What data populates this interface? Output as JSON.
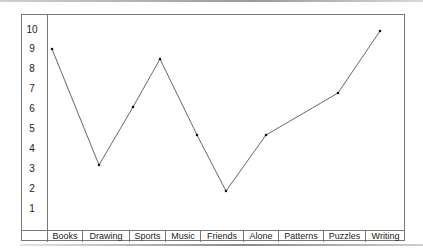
{
  "chart_data": {
    "type": "line",
    "title": "",
    "xlabel": "",
    "ylabel": "",
    "categories": [
      "Books",
      "Drawing",
      "Sports",
      "Music",
      "Friends",
      "Alone",
      "Patterns",
      "Puzzles",
      "Writing"
    ],
    "values": [
      9.0,
      3.2,
      6.1,
      8.5,
      4.7,
      1.9,
      4.7,
      6.8,
      9.9
    ],
    "yticks": [
      "10",
      "9",
      "8",
      "7",
      "6",
      "5",
      "4",
      "3",
      "2",
      "1"
    ],
    "ylim": [
      1,
      10
    ],
    "grid": false,
    "legend": null,
    "line_color": "#555555",
    "marker_color": "#111111"
  }
}
